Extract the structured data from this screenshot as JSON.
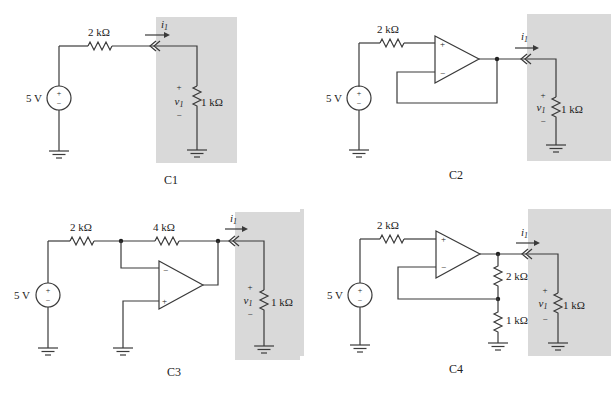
{
  "figure": {
    "circuits": [
      {
        "id": "C1",
        "caption": "C1",
        "source": {
          "label": "5 V",
          "plus": "+",
          "minus": "−"
        },
        "series_resistor": "2 kΩ",
        "load": {
          "resistor": "1 kΩ",
          "voltage_label": "v",
          "voltage_sub": "1",
          "plus": "+",
          "minus": "−"
        },
        "current": {
          "label": "i",
          "sub": "1"
        }
      },
      {
        "id": "C2",
        "caption": "C2",
        "source": {
          "label": "5 V",
          "plus": "+",
          "minus": "−"
        },
        "series_resistor": "2 kΩ",
        "opamp": {
          "plus": "+",
          "minus": "−",
          "config": "voltage follower"
        },
        "load": {
          "resistor": "1 kΩ",
          "voltage_label": "v",
          "voltage_sub": "1",
          "plus": "+",
          "minus": "−"
        },
        "current": {
          "label": "i",
          "sub": "1"
        }
      },
      {
        "id": "C3",
        "caption": "C3",
        "source": {
          "label": "5 V",
          "plus": "+",
          "minus": "−"
        },
        "input_resistor": "2 kΩ",
        "feedback_resistor": "4 kΩ",
        "opamp": {
          "plus": "+",
          "minus": "−",
          "config": "inverting amplifier"
        },
        "load": {
          "resistor": "1 kΩ",
          "voltage_label": "v",
          "voltage_sub": "1",
          "plus": "+",
          "minus": "−"
        },
        "current": {
          "label": "i",
          "sub": "1"
        }
      },
      {
        "id": "C4",
        "caption": "C4",
        "source": {
          "label": "5 V",
          "plus": "+",
          "minus": "−"
        },
        "series_resistor": "2 kΩ",
        "feedback_top": "2 kΩ",
        "feedback_bottom": "1 kΩ",
        "opamp": {
          "plus": "+",
          "minus": "−",
          "config": "non-inverting amplifier"
        },
        "load": {
          "resistor": "1 kΩ",
          "voltage_label": "v",
          "voltage_sub": "1",
          "plus": "+",
          "minus": "−"
        },
        "current": {
          "label": "i",
          "sub": "1"
        }
      }
    ],
    "colors": {
      "shade": "#d9d9d9",
      "wire": "#3a3a3a",
      "text": "#222222"
    }
  }
}
